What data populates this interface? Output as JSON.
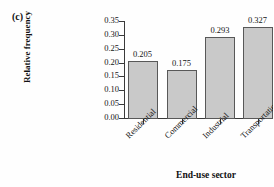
{
  "panel": {
    "label": "(c)"
  },
  "chart_data": {
    "type": "bar",
    "title": "",
    "xlabel": "End-use sector",
    "ylabel": "Relative frequency",
    "categories": [
      "Residential",
      "Commercial",
      "Industrial",
      "Transportation"
    ],
    "values": [
      0.205,
      0.175,
      0.293,
      0.327
    ],
    "value_labels": [
      "0.205",
      "0.175",
      "0.293",
      "0.327"
    ],
    "ylim": [
      0.0,
      0.35
    ],
    "ytick_labels": [
      "0.35",
      "0.30",
      "0.25",
      "0.20",
      "0.15",
      "0.10",
      "0.05",
      "0.00"
    ],
    "ytick_values": [
      0.35,
      0.3,
      0.25,
      0.2,
      0.15,
      0.1,
      0.05,
      0.0
    ],
    "grid": false,
    "legend": false,
    "legend_position": "none",
    "bar_color": "#c9c9c9",
    "bar_edge_color": "#585858",
    "axis_color": "#3a3a3a",
    "background_color": "#fefefe",
    "category_label_rotation": -45
  }
}
